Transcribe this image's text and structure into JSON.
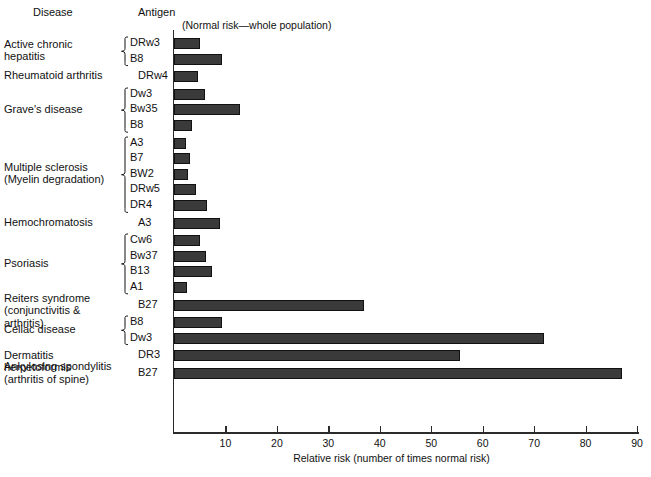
{
  "header": {
    "disease_col": "Disease",
    "antigen_col": "Antigen",
    "note": "(Normal risk—whole population)"
  },
  "axis": {
    "title": "Relative risk (number of times normal risk)",
    "ticks": [
      10,
      20,
      30,
      40,
      50,
      60,
      70,
      80,
      90
    ],
    "tick_labels": [
      "10",
      "20",
      "30",
      "40",
      "50",
      "60",
      "70",
      "80",
      "90"
    ],
    "min": 0,
    "max": 92
  },
  "groups": [
    {
      "disease": "Active chronic\nhepatitis",
      "brace": true,
      "rows": [
        {
          "antigen": "DRw3",
          "value": 5.0
        },
        {
          "antigen": "B8",
          "value": 9.3
        }
      ]
    },
    {
      "disease": "Rheumatoid arthritis",
      "brace": false,
      "rows": [
        {
          "antigen": "DRw4",
          "value": 4.7
        }
      ]
    },
    {
      "disease": "Grave's disease",
      "brace": true,
      "rows": [
        {
          "antigen": "Dw3",
          "value": 6.0
        },
        {
          "antigen": "Bw35",
          "value": 12.8
        },
        {
          "antigen": "B8",
          "value": 3.5
        }
      ]
    },
    {
      "disease": "Multiple sclerosis\n(Myelin degradation)",
      "brace": true,
      "rows": [
        {
          "antigen": "A3",
          "value": 2.3
        },
        {
          "antigen": "B7",
          "value": 3.1
        },
        {
          "antigen": "BW2",
          "value": 2.7
        },
        {
          "antigen": "DRw5",
          "value": 4.3
        },
        {
          "antigen": "DR4",
          "value": 6.4
        }
      ]
    },
    {
      "disease": "Hemochromatosis",
      "brace": false,
      "rows": [
        {
          "antigen": "A3",
          "value": 9.0
        }
      ]
    },
    {
      "disease": "Psoriasis",
      "brace": true,
      "rows": [
        {
          "antigen": "Cw6",
          "value": 5.0
        },
        {
          "antigen": "Bw37",
          "value": 6.2
        },
        {
          "antigen": "B13",
          "value": 7.4
        },
        {
          "antigen": "A1",
          "value": 2.5
        }
      ]
    },
    {
      "disease": "Reiters syndrome\n(conjunctivitis & arthritis)",
      "brace": false,
      "rows": [
        {
          "antigen": "B27",
          "value": 37.0
        }
      ]
    },
    {
      "disease": "Celiac disease",
      "brace": true,
      "rows": [
        {
          "antigen": "B8",
          "value": 9.3
        },
        {
          "antigen": "Dw3",
          "value": 72.0
        }
      ]
    },
    {
      "disease": "Dermatitis herpetoformis",
      "brace": false,
      "rows": [
        {
          "antigen": "DR3",
          "value": 55.5
        }
      ]
    },
    {
      "disease": "Ankylosing spondylitis\n(arthritis of spine)",
      "brace": false,
      "rows": [
        {
          "antigen": "B27",
          "value": 87.0
        }
      ]
    }
  ],
  "chart_data": {
    "type": "bar",
    "orientation": "horizontal",
    "title": "",
    "xlabel": "Relative risk (number of times normal risk)",
    "ylabel": "",
    "xlim": [
      0,
      92
    ],
    "grid": false,
    "legend": "none",
    "annotations": [
      "(Normal risk—whole population)"
    ],
    "categories": [
      "Active chronic hepatitis — DRw3",
      "Active chronic hepatitis — B8",
      "Rheumatoid arthritis — DRw4",
      "Grave's disease — Dw3",
      "Grave's disease — Bw35",
      "Grave's disease — B8",
      "Multiple sclerosis (Myelin degradation) — A3",
      "Multiple sclerosis (Myelin degradation) — B7",
      "Multiple sclerosis (Myelin degradation) — BW2",
      "Multiple sclerosis (Myelin degradation) — DRw5",
      "Multiple sclerosis (Myelin degradation) — DR4",
      "Hemochromatosis — A3",
      "Psoriasis — Cw6",
      "Psoriasis — Bw37",
      "Psoriasis — B13",
      "Psoriasis — A1",
      "Reiters syndrome (conjunctivitis & arthritis) — B27",
      "Celiac disease — B8",
      "Celiac disease — Dw3",
      "Dermatitis herpetoformis — DR3",
      "Ankylosing spondylitis (arthritis of spine) — B27"
    ],
    "values": [
      5.0,
      9.3,
      4.7,
      6.0,
      12.8,
      3.5,
      2.3,
      3.1,
      2.7,
      4.3,
      6.4,
      9.0,
      5.0,
      6.2,
      7.4,
      2.5,
      37.0,
      9.3,
      72.0,
      55.5,
      87.0
    ],
    "bar_color": "#3a3a3a"
  }
}
